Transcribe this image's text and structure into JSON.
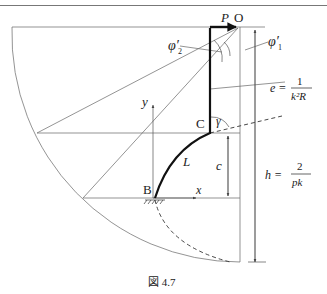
{
  "figure": {
    "caption": "図 4.7",
    "header_fragment": "",
    "labels": {
      "P": "P",
      "O": "O",
      "phi2": "φ′",
      "phi2_sub": "2",
      "phi1": "φ′",
      "phi1_sub": "1",
      "e_lhs": "e =",
      "e_num": "1",
      "e_den": "k²R",
      "y_axis": "y",
      "x_axis": "x",
      "C": "C",
      "gamma": "γ",
      "L": "L",
      "c": "c",
      "B": "B",
      "h_lhs": "h =",
      "h_num": "2",
      "h_den": "pk"
    },
    "colors": {
      "line": "#555555",
      "thick": "#111111",
      "text": "#222222"
    }
  }
}
